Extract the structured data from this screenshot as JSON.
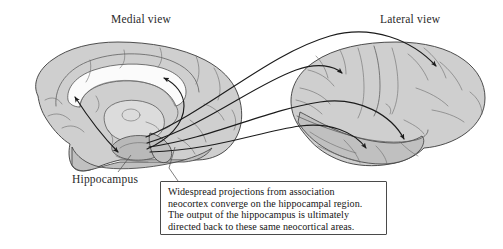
{
  "figure": {
    "title_medial": "Medial view",
    "title_lateral": "Lateral view",
    "hippocampus_label": "Hippocampus",
    "caption_line_1": "Widespread projections from association",
    "caption_line_2": "neocortex converge on the hippocampal region.",
    "caption_line_3": "The output of the hippocampus is ultimately",
    "caption_line_4": "directed back to these same neocortical areas."
  },
  "colors": {
    "background": "#ffffff",
    "brain_fill": "#cfcfcf",
    "brain_fill_dark": "#c0c0c0",
    "brain_fill_light": "#dcdcdc",
    "white_matter": "#fbfbfb",
    "hippocampus_fill": "#b9b9b9",
    "outline": "#3b3b3b",
    "sulcus": "#5a5a5a",
    "arrow": "#1b1b1b",
    "caption_border": "#4a4a4a",
    "text": "#161616"
  },
  "diagram": {
    "type": "anatomical-illustration",
    "panels": [
      {
        "name": "medial-view",
        "label": "Medial view"
      },
      {
        "name": "lateral-view",
        "label": "Lateral view"
      }
    ],
    "structures": [
      "cerebral cortex",
      "corpus callosum",
      "thalamus",
      "hippocampus",
      "temporal lobe",
      "brainstem"
    ],
    "projection_arrows": {
      "converging_on_hippocampus": 4,
      "origin": "association neocortex",
      "target": "hippocampal region",
      "bidirectional_medial_arrow": 1,
      "curved_medial_arrow": 1
    }
  }
}
